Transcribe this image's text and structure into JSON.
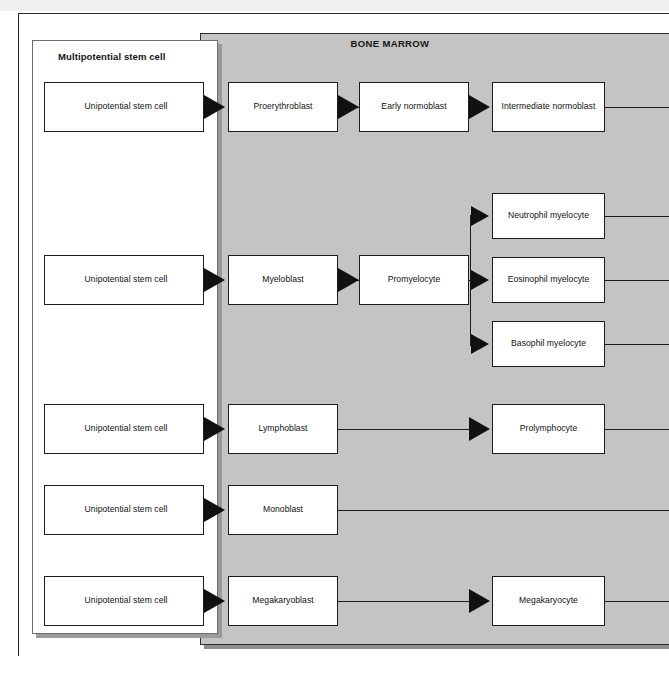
{
  "figure": {
    "top_strip_text": "·  ·  ·· ·   ·  ·   ··  ·    ·  ·· ·",
    "outer_frame_name": "page-border"
  },
  "stem_panel": {
    "title": "Multipotential stem cell",
    "cells": [
      {
        "label": "Unipotential stem cell"
      },
      {
        "label": "Unipotential stem cell"
      },
      {
        "label": "Unipotential stem cell"
      },
      {
        "label": "Unipotential stem cell"
      },
      {
        "label": "Unipotential stem cell"
      }
    ]
  },
  "marrow": {
    "title": "BONE MARROW"
  },
  "lineages": {
    "erythroid": {
      "stages": [
        {
          "label": "Proerythroblast"
        },
        {
          "label": "Early normoblast"
        },
        {
          "label": "Intermediate normoblast"
        }
      ]
    },
    "granulocytic": {
      "stages": [
        {
          "label": "Myeloblast"
        },
        {
          "label": "Promyelocyte"
        }
      ],
      "branches": [
        {
          "label": "Neutrophil myelocyte"
        },
        {
          "label": "Eosinophil myelocyte"
        },
        {
          "label": "Basophil myelocyte"
        }
      ]
    },
    "lymphoid": {
      "stages": [
        {
          "label": "Lymphoblast"
        },
        {
          "label": "Prolymphocyte"
        }
      ]
    },
    "monocytic": {
      "stages": [
        {
          "label": "Monoblast"
        }
      ]
    },
    "megakaryocytic": {
      "stages": [
        {
          "label": "Megakaryoblast"
        },
        {
          "label": "Megakaryocyte"
        }
      ]
    }
  },
  "colors": {
    "marrow_background": "#c4c4c4",
    "panel_background": "#ffffff",
    "line": "#1d1d1d",
    "arrow": "#111111",
    "shadow": "#8d8d8d"
  }
}
